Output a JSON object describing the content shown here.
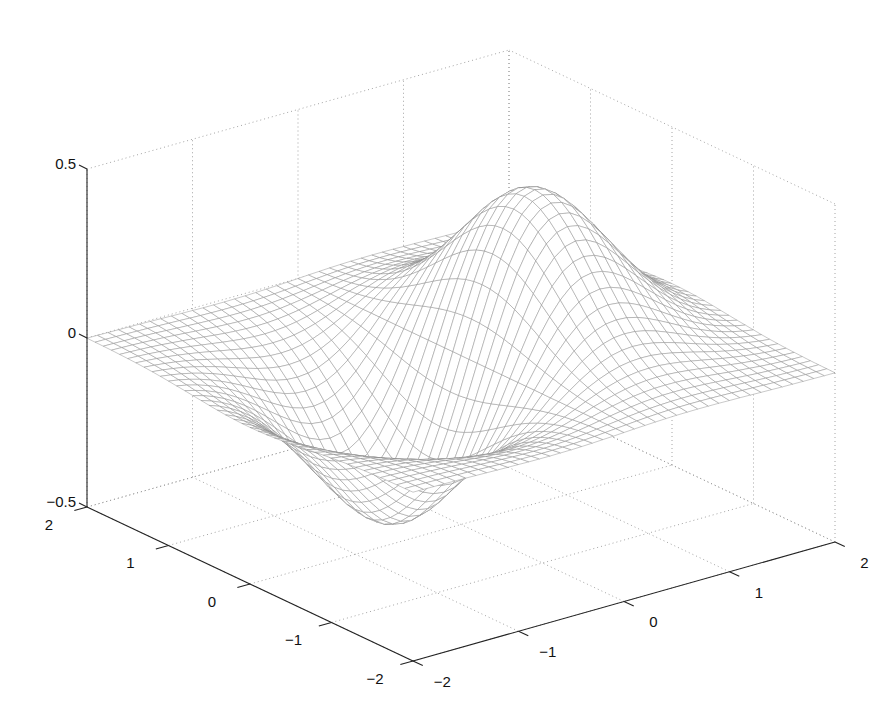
{
  "chart_data": {
    "type": "surface-mesh",
    "title": "",
    "function": "z = x*exp(-x^2-y^2)",
    "x": {
      "label": "",
      "range": [
        -2,
        2
      ],
      "ticks": [
        -2,
        -1,
        0,
        1,
        2
      ],
      "tick_labels": [
        "−2",
        "−1",
        "0",
        "1",
        "2"
      ]
    },
    "y": {
      "label": "",
      "range": [
        -2,
        2
      ],
      "ticks": [
        -2,
        -1,
        0,
        1,
        2
      ],
      "tick_labels": [
        "−2",
        "−1",
        "0",
        "1",
        "2"
      ]
    },
    "z": {
      "label": "",
      "range": [
        -0.5,
        0.5
      ],
      "ticks": [
        -0.5,
        0,
        0.5
      ],
      "tick_labels": [
        "−0.5",
        "0",
        "0.5"
      ]
    },
    "mesh_step": 0.1,
    "grid": true,
    "legend": null,
    "peak": {
      "x": 0.707,
      "y": 0,
      "z": 0.429
    },
    "trough": {
      "x": -0.707,
      "y": 0,
      "z": -0.429
    },
    "colors": {
      "mesh_line": "#8a8a8a",
      "axis": "#222222",
      "grid": "#9a9a9a",
      "background": "#ffffff"
    }
  },
  "projection": {
    "origin_screen": [
      461,
      355.5
    ],
    "x_unit": [
      105.5,
      -29.75
    ],
    "y_unit": [
      -81.5,
      -38.5
    ],
    "z_unit": -338
  }
}
